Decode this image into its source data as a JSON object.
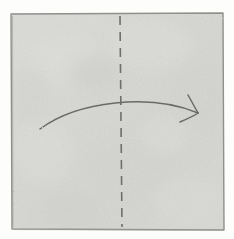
{
  "figure": {
    "description": "Hand-drawn square sheet of paper with a vertical dashed fold line down the centre and a curved arrow sweeping from the left edge to the right edge, indicating the right half folds over onto the left half.",
    "medium": "pencil sketch on textured paper",
    "canvas": {
      "width": 234,
      "height": 239
    }
  },
  "colors": {
    "background": "#fdfdfc",
    "paper_fill": "#d9d9d6",
    "paper_fill_light": "#e3e3e0",
    "paper_fill_shadow": "#cdcdc9",
    "paper_edge": "#8f8f8c",
    "fold_line": "#6e6e6b",
    "arrow_stroke": "#6a6a68",
    "texture": "#c6c6c2"
  },
  "shapes": {
    "paper_sheet": {
      "name": "square sheet",
      "corners": {
        "top_left": [
          11,
          14
        ],
        "top_right": [
          223,
          13
        ],
        "bottom_right": [
          224,
          230
        ],
        "bottom_left": [
          12,
          229
        ]
      },
      "stroke_width": 1.4
    },
    "fold_line": {
      "name": "vertical centre fold line",
      "style": "dashed",
      "orientation": "vertical",
      "x_top": 120,
      "y_top": 16,
      "x_bottom": 122,
      "y_bottom": 227,
      "dash_length": 9,
      "gap_length": 7,
      "stroke_width": 1.6
    },
    "fold_arrow": {
      "name": "curved fold arrow",
      "direction": "left-to-right",
      "tail": [
        40,
        129
      ],
      "control_1": [
        78,
        101
      ],
      "control_2": [
        150,
        93
      ],
      "tip": [
        198,
        113
      ],
      "stroke_width": 1.5,
      "arrowhead": {
        "upper_barb_end": [
          188,
          95
        ],
        "lower_barb_end": [
          180,
          122
        ],
        "stroke_width": 1.5
      }
    }
  },
  "annotations": {
    "fold_line_label": "centre fold line",
    "arrow_label": "fold this way",
    "paper_label": "paper sheet"
  }
}
